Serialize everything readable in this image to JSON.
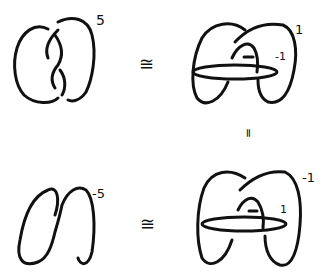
{
  "diagram": {
    "panels": [
      {
        "id": "top-left",
        "description": "two-strand twisted knot diagram",
        "framing": "5"
      },
      {
        "id": "top-right",
        "description": "knot with surgery circle",
        "framing": "1",
        "inner_framing": "-1",
        "crossing_mark": "-"
      },
      {
        "id": "bottom-left",
        "description": "simple loop diagram",
        "framing": "-5"
      },
      {
        "id": "bottom-right",
        "description": "knot with surgery circle",
        "framing": "-1",
        "inner_framing": "1",
        "crossing_mark": "-"
      }
    ],
    "relations": {
      "top": "≅",
      "bottom": "≅",
      "vertical": "="
    }
  }
}
